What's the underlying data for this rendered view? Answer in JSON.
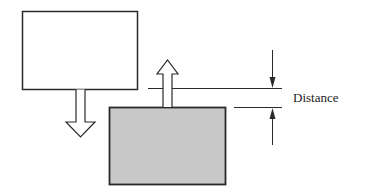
{
  "diagram": {
    "upper_body": {
      "fill": "#ffffff",
      "stroke": "#2a2a2a"
    },
    "lower_body": {
      "fill": "#c8c8c8",
      "stroke": "#2a2a2a"
    },
    "motion_arrows": [
      {
        "id": "upper-body-motion",
        "direction": "down"
      },
      {
        "id": "lower-body-motion",
        "direction": "up"
      }
    ],
    "dimension": {
      "label": "Distance",
      "arrows": [
        "down",
        "up"
      ]
    }
  }
}
